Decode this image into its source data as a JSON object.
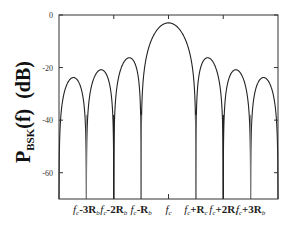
{
  "chart_data": {
    "type": "line",
    "title": "",
    "xlabel": "",
    "ylabel": {
      "main": "P",
      "subscript": "BSK",
      "rest": "(f)  (dB)"
    },
    "xlim_rb_units": [
      -4,
      4
    ],
    "ylim": [
      -70,
      0
    ],
    "yticks": [
      0,
      -20,
      -40,
      -60
    ],
    "ytick_labels": [
      "0",
      "-20",
      "-40",
      "-60"
    ],
    "xticks": [
      {
        "offset": -3,
        "base": "f",
        "sub": "c",
        "op": "-3",
        "R": "R",
        "Rsub": "b"
      },
      {
        "offset": -2,
        "base": "f",
        "sub": "c",
        "op": "-2",
        "R": "R",
        "Rsub": "b"
      },
      {
        "offset": -1,
        "base": "f",
        "sub": "c",
        "op": "-",
        "R": "R",
        "Rsub": "b"
      },
      {
        "offset": 0,
        "base": "f",
        "sub": "c",
        "op": "",
        "R": "",
        "Rsub": ""
      },
      {
        "offset": 1,
        "base": "f",
        "sub": "c",
        "op": "+",
        "R": "R",
        "Rsub": "c"
      },
      {
        "offset": 2,
        "base": "f",
        "sub": "c",
        "op": "+2",
        "R": "R",
        "Rsub": "l"
      },
      {
        "offset": 3,
        "base": "f",
        "sub": "c",
        "op": "+3",
        "R": "R",
        "Rsub": "b"
      }
    ],
    "series": [
      {
        "name": "BPSK PSD",
        "function": "sinc^2((f-fc)/Rb)",
        "peak_db": -3,
        "sidelobe_peaks_db": [
          {
            "offset": -3.5,
            "value": -23.5
          },
          {
            "offset": -2.5,
            "value": -20.5
          },
          {
            "offset": -1.5,
            "value": -16.5
          },
          {
            "offset": 1.5,
            "value": -16.5
          },
          {
            "offset": 2.5,
            "value": -20.5
          },
          {
            "offset": 3.5,
            "value": -23.5
          }
        ],
        "nulls_offsets": [
          -4,
          -3,
          -2,
          -1,
          1,
          2,
          3,
          4
        ]
      }
    ],
    "grid": false,
    "legend": "none"
  }
}
